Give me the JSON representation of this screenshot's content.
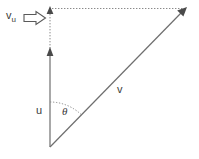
{
  "figure": {
    "kind": "vector-decomposition-diagram",
    "background_color": "#ffffff",
    "line_color": "#6e6e6e",
    "dotted_color": "#8a8a8a",
    "text_color": "#3a3a3a",
    "labels": {
      "projection_base": "v",
      "projection_subscript": "u",
      "block_arrow_glyph": "block-arrow-right",
      "vector_u": "u",
      "vector_v": "v",
      "angle": "θ"
    },
    "geometry": {
      "origin": [
        50,
        147
      ],
      "u_tip": [
        50,
        50
      ],
      "v_tip": [
        187,
        8
      ],
      "projection_tip": [
        50,
        9
      ],
      "arc_radius": 45
    }
  }
}
